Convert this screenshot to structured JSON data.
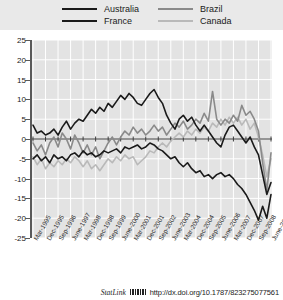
{
  "legend": {
    "items": [
      {
        "label": "Australia",
        "color": "#1a1a1a",
        "key": "australia"
      },
      {
        "label": "Brazil",
        "color": "#8a8a8a",
        "key": "brazil"
      },
      {
        "label": "France",
        "color": "#1a1a1a",
        "key": "france"
      },
      {
        "label": "Canada",
        "color": "#b9b9b9",
        "key": "canada"
      }
    ]
  },
  "source": {
    "statlink_label": "StatLink",
    "barcode_icon": "barcode-icon",
    "url": "http://dx.doi.org/10.1787/823275077561"
  },
  "chart_data": {
    "type": "line",
    "title": "",
    "subtitle": "",
    "xlabel": "",
    "ylabel": "",
    "ylim": [
      -25,
      25
    ],
    "ytick_step": 5,
    "yticks": [
      25,
      20,
      15,
      10,
      5,
      0,
      -5,
      -10,
      -15,
      -20,
      -25
    ],
    "grid": true,
    "legend_position": "top",
    "zero_line": 0,
    "x": [
      "Mar-1995",
      "June-1995",
      "Sep-1995",
      "Dec-1995",
      "Mar-1996",
      "June-1996",
      "Sep-1996",
      "Dec-1996",
      "Mar-1997",
      "June-1997",
      "Sep-1997",
      "Dec-1997",
      "Mar-1998",
      "June-1998",
      "Sep-1998",
      "Dec-1998",
      "Mar-1999",
      "June-1999",
      "Sep-1999",
      "Dec-1999",
      "Mar-2000",
      "June-2000",
      "Sep-2000",
      "Dec-2000",
      "Mar-2001",
      "June-2001",
      "Sep-2001",
      "Dec-2001",
      "Mar-2002",
      "June-2002",
      "Sep-2002",
      "Dec-2002",
      "Mar-2003",
      "June-2003",
      "Sep-2003",
      "Dec-2003",
      "Mar-2004",
      "June-2004",
      "Sep-2004",
      "Dec-2004",
      "Mar-2005",
      "June-2005",
      "Sep-2005",
      "Dec-2005",
      "Mar-2006",
      "June-2006",
      "Sep-2006",
      "Dec-2006",
      "Mar-2007",
      "June-2007",
      "Sep-2007",
      "Dec-2007",
      "Mar-2008",
      "June-2008",
      "Sep-2008",
      "Dec-2008",
      "Mar-2009",
      "June-2009"
    ],
    "xtick_labels": [
      "Mar-1995",
      "Dec-1995",
      "Sep-1996",
      "June-1997",
      "Mar-1998",
      "Dec-1998",
      "Sep-1999",
      "June-2000",
      "Mar-2001",
      "Dec-2001",
      "Sep-2002",
      "June-2003",
      "Mar-2004",
      "Dec-2004",
      "Sep-2005",
      "June-2006",
      "Mar-2007",
      "Dec-2007",
      "Sep-2008",
      "June-2009"
    ],
    "xtick_indices": [
      0,
      3,
      6,
      9,
      12,
      15,
      18,
      21,
      24,
      27,
      30,
      33,
      36,
      39,
      42,
      45,
      48,
      51,
      54,
      57
    ],
    "series": [
      {
        "name": "Australia",
        "color": "#1a1a1a",
        "width": 1.6,
        "values": [
          3.5,
          1.5,
          2.0,
          1.0,
          1.5,
          2.5,
          1.0,
          3.0,
          4.5,
          2.5,
          4.0,
          5.0,
          4.5,
          6.0,
          7.5,
          6.5,
          8.0,
          7.0,
          9.0,
          8.0,
          9.5,
          11.0,
          10.0,
          11.5,
          10.5,
          9.0,
          8.5,
          10.0,
          11.5,
          12.5,
          10.5,
          9.0,
          6.0,
          4.0,
          2.5,
          5.0,
          6.0,
          4.5,
          5.5,
          3.5,
          2.0,
          3.5,
          2.0,
          0.5,
          -1.0,
          -2.0,
          1.0,
          3.0,
          3.5,
          2.0,
          0.5,
          -1.0,
          0.5,
          -2.0,
          -4.0,
          -9.0,
          -14.0,
          -11.0
        ]
      },
      {
        "name": "Brazil",
        "color": "#8a8a8a",
        "width": 1.6,
        "values": [
          -1.0,
          -3.0,
          -1.5,
          -4.0,
          -1.0,
          0.5,
          -2.0,
          1.5,
          0.0,
          -2.5,
          1.0,
          -1.0,
          -3.5,
          -1.5,
          -4.0,
          -2.0,
          -5.0,
          -3.0,
          -1.0,
          0.5,
          -1.5,
          0.5,
          2.0,
          1.0,
          3.0,
          1.5,
          2.5,
          1.0,
          2.0,
          3.5,
          2.0,
          3.0,
          1.0,
          2.5,
          4.0,
          3.0,
          4.5,
          2.5,
          3.5,
          5.0,
          4.0,
          6.5,
          4.5,
          12.0,
          5.0,
          3.5,
          5.0,
          4.0,
          6.0,
          4.5,
          8.5,
          6.0,
          7.0,
          5.0,
          2.0,
          -6.0,
          -13.0,
          -3.5
        ]
      },
      {
        "name": "France",
        "color": "#1a1a1a",
        "width": 1.6,
        "values": [
          -5.0,
          -4.0,
          -5.5,
          -4.5,
          -6.0,
          -4.0,
          -5.0,
          -4.5,
          -5.5,
          -4.0,
          -3.5,
          -4.5,
          -3.0,
          -4.0,
          -3.5,
          -4.5,
          -4.0,
          -3.0,
          -3.5,
          -3.0,
          -2.5,
          -3.5,
          -2.0,
          -2.5,
          -2.0,
          -1.5,
          -2.5,
          -2.0,
          -1.0,
          -1.5,
          -2.5,
          -3.0,
          -4.0,
          -5.0,
          -4.5,
          -6.0,
          -7.0,
          -6.0,
          -7.5,
          -8.5,
          -8.0,
          -9.5,
          -9.0,
          -10.0,
          -9.0,
          -8.5,
          -9.5,
          -9.0,
          -10.0,
          -11.5,
          -12.5,
          -14.0,
          -16.0,
          -18.0,
          -20.5,
          -17.0,
          -20.0,
          -14.0
        ]
      },
      {
        "name": "Canada",
        "color": "#b9b9b9",
        "width": 1.6,
        "values": [
          -4.5,
          -6.5,
          -5.0,
          -7.5,
          -6.0,
          -7.0,
          -5.5,
          -6.5,
          -5.0,
          -6.0,
          -4.5,
          -5.5,
          -7.0,
          -5.5,
          -7.5,
          -6.5,
          -8.0,
          -6.5,
          -5.0,
          -6.0,
          -4.5,
          -5.5,
          -4.0,
          -5.0,
          -4.5,
          -6.5,
          -5.5,
          -4.5,
          -3.0,
          -3.5,
          -2.0,
          -1.0,
          -2.0,
          -0.5,
          0.5,
          1.5,
          0.5,
          2.0,
          1.0,
          2.5,
          1.5,
          3.0,
          2.0,
          4.0,
          3.0,
          5.0,
          3.5,
          5.5,
          4.0,
          5.5,
          3.5,
          5.0,
          2.5,
          4.0,
          0.5,
          -4.0,
          -9.5,
          -5.0
        ]
      }
    ]
  }
}
